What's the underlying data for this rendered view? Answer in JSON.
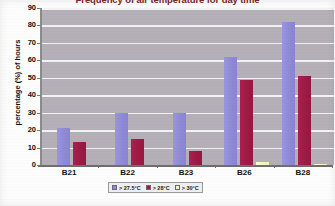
{
  "chart_data": {
    "type": "bar",
    "title": "Frequency of air temperature for day time",
    "xlabel": "",
    "ylabel": "percentage (%) of hours",
    "categories": [
      "B21",
      "B22",
      "B23",
      "B26",
      "B28"
    ],
    "series": [
      {
        "name": "> 27.5°C",
        "color": "#8f8ad6",
        "values": [
          21,
          30,
          30,
          62,
          82
        ]
      },
      {
        "name": "> 28°C",
        "color": "#9e1a46",
        "values": [
          13,
          15,
          8,
          48.5,
          51
        ]
      },
      {
        "name": "> 30°C",
        "color": "#f6f6c4",
        "values": [
          0,
          0,
          0,
          1.5,
          0.5
        ]
      }
    ],
    "ylim": [
      0,
      90
    ],
    "yticks": [
      0,
      10,
      20,
      30,
      40,
      50,
      60,
      70,
      80,
      90
    ],
    "ytick_labels": [
      "0",
      "10",
      "20",
      "30",
      "40",
      "50",
      "60",
      "70",
      "80",
      "90"
    ],
    "grid": true,
    "legend_position": "bottom",
    "plot_background": "#b5afb8",
    "gridline_color": "#f2f2f2"
  }
}
